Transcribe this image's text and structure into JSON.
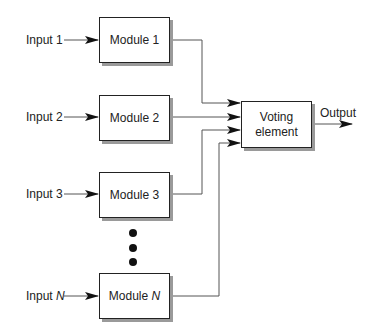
{
  "diagram": {
    "type": "N-modular redundancy block diagram",
    "inputs": [
      {
        "label": "Input 1",
        "var": ""
      },
      {
        "label": "Input 2",
        "var": ""
      },
      {
        "label": "Input 3",
        "var": ""
      },
      {
        "label": "Input ",
        "var": "N"
      }
    ],
    "modules": [
      {
        "label": "Module 1",
        "var": ""
      },
      {
        "label": "Module 2",
        "var": ""
      },
      {
        "label": "Module 3",
        "var": ""
      },
      {
        "label": "Module ",
        "var": "N"
      }
    ],
    "voter": {
      "line1": "Voting",
      "line2": "element"
    },
    "output": {
      "label": "Output"
    },
    "ellipsis_dots": 3,
    "colors": {
      "line": "#555555",
      "box_border": "#222222",
      "shadow": "#9a9a9a"
    }
  }
}
